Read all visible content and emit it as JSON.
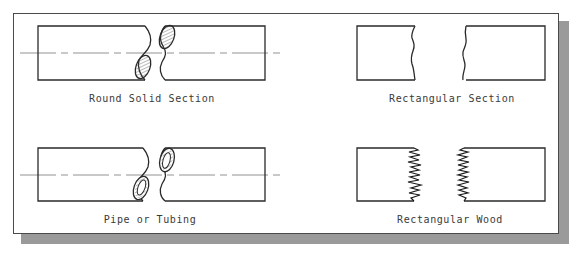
{
  "diagram": {
    "colors": {
      "line": "#2a2a2a",
      "centerline": "#777777",
      "hatch": "#555555",
      "shadow": "#9a9a9a",
      "text": "#3a3a3a",
      "background": "#ffffff"
    },
    "symbols": [
      {
        "id": "round-solid",
        "label": "Round Solid Section",
        "break_type": "S-break with hatched section"
      },
      {
        "id": "rectangular-section",
        "label": "Rectangular Section",
        "break_type": "freehand wavy break"
      },
      {
        "id": "pipe-tubing",
        "label": "Pipe or Tubing",
        "break_type": "S-break with hollow ring section"
      },
      {
        "id": "rectangular-wood",
        "label": "Rectangular Wood",
        "break_type": "zigzag splintered break"
      }
    ]
  }
}
